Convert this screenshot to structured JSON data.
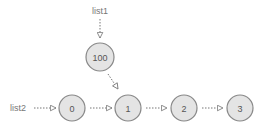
{
  "labels": {
    "list1": "list1",
    "list2": "list2"
  },
  "nodes": [
    {
      "id": "n100",
      "value": "100"
    },
    {
      "id": "n0",
      "value": "0"
    },
    {
      "id": "n1",
      "value": "1"
    },
    {
      "id": "n2",
      "value": "2"
    },
    {
      "id": "n3",
      "value": "3"
    }
  ],
  "colors": {
    "node_fill": "#e4e4e4",
    "node_stroke": "#888888",
    "arrow": "#777777",
    "text": "#555555"
  }
}
